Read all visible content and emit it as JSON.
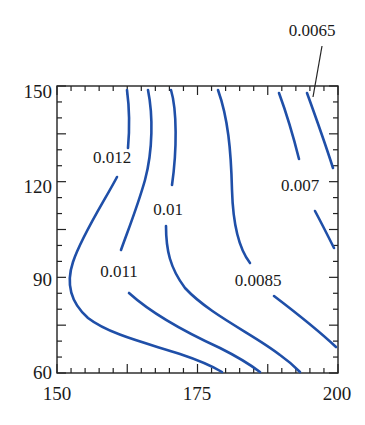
{
  "chart_data": {
    "type": "contour",
    "title": "",
    "xlabel": "",
    "ylabel": "",
    "xlim": [
      150,
      200
    ],
    "ylim": [
      60,
      150
    ],
    "x_ticks": [
      "150",
      "175",
      "200"
    ],
    "y_ticks": [
      "60",
      "90",
      "120",
      "150"
    ],
    "x_minor_step": 2.5,
    "y_minor_step": 5,
    "grid": false,
    "line_color": "#1f4fa8",
    "levels": [
      {
        "value": "0.012",
        "label_pos": [
          156,
          130
        ]
      },
      {
        "value": "0.011",
        "label_pos": [
          155,
          86
        ]
      },
      {
        "value": "0.01",
        "label_pos": [
          171,
          110
        ]
      },
      {
        "value": "0.0085",
        "label_pos": [
          189,
          85
        ]
      },
      {
        "value": "0.007",
        "label_pos": [
          197,
          117
        ]
      },
      {
        "value": "0.0065",
        "label_pos": [
          199,
          162
        ],
        "leader_to": [
          197,
          149
        ]
      }
    ]
  },
  "labels": {
    "l0065": "0.0065",
    "l012": "0.012",
    "l011": "0.011",
    "l01": "0.01",
    "l0085": "0.0085",
    "l007": "0.007",
    "x150": "150",
    "x175": "175",
    "x200": "200",
    "y60": "60",
    "y90": "90",
    "y120": "120",
    "y150": "150"
  }
}
